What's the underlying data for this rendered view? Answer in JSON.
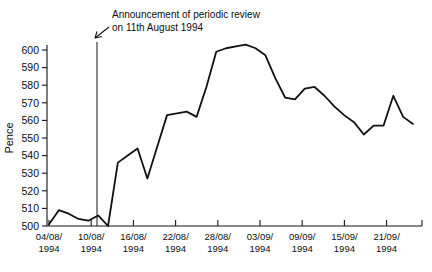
{
  "chart_data": {
    "type": "line",
    "title": "",
    "xlabel": "",
    "ylabel": "Pence",
    "ylim": [
      500,
      605
    ],
    "yticks": [
      500,
      510,
      520,
      530,
      540,
      550,
      560,
      570,
      580,
      590,
      600
    ],
    "grid": false,
    "legend": null,
    "annotations": [
      {
        "name": "announcement-marker",
        "text_line1": "Announcement of periodic review",
        "text_line2": "on 11th August 1994",
        "marker_type": "vertical-line-with-arrow",
        "x_value": "11/08/1994"
      }
    ],
    "categories": [
      "04/08/1994",
      "05/08/1994",
      "08/08/1994",
      "09/08/1994",
      "10/08/1994",
      "11/08/1994",
      "12/08/1994",
      "15/08/1994",
      "16/08/1994",
      "17/08/1994",
      "18/08/1994",
      "19/08/1994",
      "22/08/1994",
      "23/08/1994",
      "24/08/1994",
      "25/08/1994",
      "26/08/1994",
      "30/08/1994",
      "31/08/1994",
      "01/09/1994",
      "02/09/1994",
      "05/09/1994",
      "06/09/1994",
      "07/09/1994",
      "08/09/1994",
      "09/09/1994",
      "12/09/1994",
      "13/09/1994",
      "14/09/1994",
      "15/09/1994",
      "16/09/1994",
      "19/09/1994",
      "20/09/1994",
      "21/09/1994",
      "22/09/1994",
      "23/09/1994",
      "26/09/1994",
      "27/09/1994"
    ],
    "x_tick_labels": [
      "04/08/\n1994",
      "10/08/\n1994",
      "16/08/\n1994",
      "22/08/\n1994",
      "28/08/\n1994",
      "03/09/\n1994",
      "09/09/\n1994",
      "15/09/\n1994",
      "21/09/\n1994"
    ],
    "x_tick_labels_top": [
      "04/08/",
      "10/08/",
      "16/08/",
      "22/08/",
      "28/08/",
      "03/09/",
      "09/09/",
      "15/09/",
      "21/09/"
    ],
    "x_tick_labels_bottom": [
      "1994",
      "1994",
      "1994",
      "1994",
      "1994",
      "1994",
      "1994",
      "1994",
      "1994"
    ],
    "values": [
      501,
      509,
      507,
      504,
      503,
      506,
      500,
      536,
      540,
      544,
      527,
      545,
      563,
      564,
      565,
      562,
      579,
      599,
      601,
      602,
      603,
      601,
      597,
      584,
      573,
      572,
      578,
      579,
      574,
      568,
      563,
      559,
      552,
      557,
      557,
      574,
      562,
      558
    ],
    "series_color": "#111111",
    "axis_color": "#141414"
  }
}
